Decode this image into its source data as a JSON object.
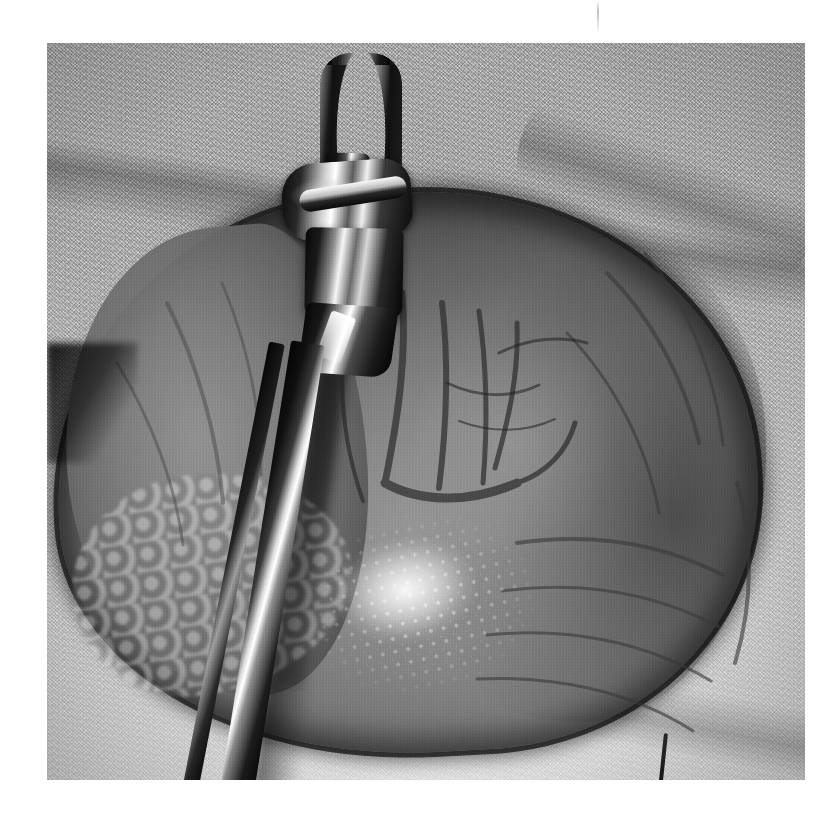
{
  "page": {
    "background_color": "#ffffff",
    "width": 838,
    "height": 824
  },
  "figure": {
    "type": "photograph",
    "modality": "intraoperative clinical photograph",
    "color_mode": "grayscale",
    "caption": "",
    "label": "",
    "photo_frame": {
      "left": 47,
      "top": 43,
      "width": 758,
      "height": 737,
      "border": "none"
    }
  },
  "scene": {
    "description": "Open surgical field: a large exposed abdominal organ is elevated and held by a long metal clamp, surrounded by textured white surgical drapes.",
    "elements": [
      {
        "name": "surgical-drape",
        "label": "Surgical drape / towel",
        "tone": "light gray",
        "texture": "woven speckled huck towel",
        "hex": "#d8d8d6",
        "position": "background, upper and lower periphery"
      },
      {
        "name": "organ-mass",
        "label": "Exposed organ",
        "tone": "mid gray",
        "hex": "#8b8b88",
        "position": "center, spanning most of the frame",
        "features": [
          "two lobes separated by a fissure",
          "branching surface vessels",
          "wet specular highlights",
          "dark shadowed inferior border"
        ]
      },
      {
        "name": "surgical-clamp",
        "label": "Metal surgical clamp / retractor",
        "tone": "dark metal with bright specular highlights",
        "hex": "#1a1a1a",
        "highlight_hex": "#ffffff",
        "position": "vertical, entering top center and running diagonally to the bottom edge",
        "parts": [
          "ring handle",
          "shaft",
          "ratchet lock",
          "box joint",
          "jaw tip"
        ]
      },
      {
        "name": "omental-fat",
        "label": "Lobulated fatty tissue",
        "tone": "light gray",
        "position": "lower left of the organ"
      },
      {
        "name": "suture-thread",
        "label": "Dark thread on drape",
        "tone": "near black",
        "position": "lower right of frame"
      }
    ]
  },
  "artifacts": {
    "scan_line": {
      "name": "vertical-scan-artifact",
      "label": "Faint vertical scan line",
      "x": 597,
      "top": 0,
      "height": 33
    }
  },
  "palette": {
    "page_white": "#ffffff",
    "drape_light": "#e6e6e4",
    "drape_mid": "#c2c2c0",
    "organ_mid": "#8b8b88",
    "organ_dark": "#4a4a48",
    "metal_dark": "#0d0d0d",
    "specular_white": "#ffffff"
  }
}
